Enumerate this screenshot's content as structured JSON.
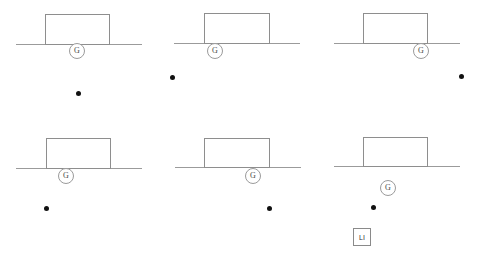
{
  "canvas": {
    "width": 477,
    "height": 259,
    "background": "#ffffff",
    "line_color": "#9b9b9b",
    "block_stroke": "#8e8e8e",
    "dot_color": "#111111"
  },
  "legend": {
    "g_label": "G",
    "li_label": "LI"
  },
  "panels": [
    {
      "id": "panel-1",
      "row": 1,
      "col": 1,
      "ground": {
        "x": 16,
        "y": 44,
        "width": 126,
        "height": 1
      },
      "block": {
        "x": 45,
        "y": 14,
        "width": 65,
        "height": 31
      },
      "g_marker": {
        "label": "G",
        "cx": 77,
        "cy": 51,
        "r": 8
      },
      "dot": {
        "cx": 78,
        "cy": 93,
        "r": 2.5
      },
      "li_box": null
    },
    {
      "id": "panel-2",
      "row": 1,
      "col": 2,
      "ground": {
        "x": 174,
        "y": 43,
        "width": 126,
        "height": 1
      },
      "block": {
        "x": 204,
        "y": 13,
        "width": 66,
        "height": 31
      },
      "g_marker": {
        "label": "G",
        "cx": 215,
        "cy": 51,
        "r": 8
      },
      "dot": {
        "cx": 172,
        "cy": 77,
        "r": 2.5
      },
      "li_box": null
    },
    {
      "id": "panel-3",
      "row": 1,
      "col": 3,
      "ground": {
        "x": 334,
        "y": 43,
        "width": 126,
        "height": 1
      },
      "block": {
        "x": 363,
        "y": 13,
        "width": 65,
        "height": 31
      },
      "g_marker": {
        "label": "G",
        "cx": 421,
        "cy": 51,
        "r": 8
      },
      "dot": {
        "cx": 461,
        "cy": 76,
        "r": 2.5
      },
      "li_box": null
    },
    {
      "id": "panel-4",
      "row": 2,
      "col": 1,
      "ground": {
        "x": 16,
        "y": 168,
        "width": 126,
        "height": 1
      },
      "block": {
        "x": 46,
        "y": 138,
        "width": 65,
        "height": 31
      },
      "g_marker": {
        "label": "G",
        "cx": 66,
        "cy": 176,
        "r": 8
      },
      "dot": {
        "cx": 46,
        "cy": 208,
        "r": 2.5
      },
      "li_box": null
    },
    {
      "id": "panel-5",
      "row": 2,
      "col": 2,
      "ground": {
        "x": 175,
        "y": 167,
        "width": 126,
        "height": 1
      },
      "block": {
        "x": 204,
        "y": 138,
        "width": 66,
        "height": 30
      },
      "g_marker": {
        "label": "G",
        "cx": 253,
        "cy": 176,
        "r": 8
      },
      "dot": {
        "cx": 269,
        "cy": 208,
        "r": 2.5
      },
      "li_box": null
    },
    {
      "id": "panel-6",
      "row": 2,
      "col": 3,
      "ground": {
        "x": 334,
        "y": 166,
        "width": 126,
        "height": 1
      },
      "block": {
        "x": 363,
        "y": 137,
        "width": 65,
        "height": 30
      },
      "g_marker": {
        "label": "G",
        "cx": 388,
        "cy": 188,
        "r": 8
      },
      "dot": {
        "cx": 373,
        "cy": 207,
        "r": 2.5
      },
      "li_box": {
        "label": "LI",
        "x": 353,
        "y": 228,
        "width": 18,
        "height": 18
      }
    }
  ]
}
